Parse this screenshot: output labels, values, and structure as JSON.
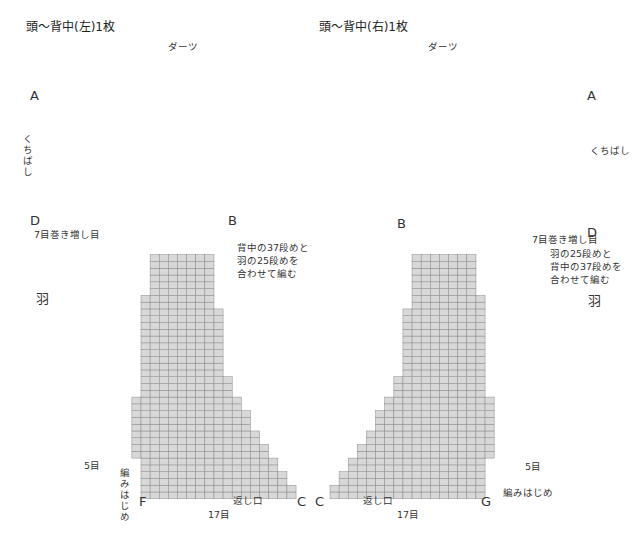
{
  "colors": {
    "dark": "#7d7d7d",
    "dark_dash": "#4a4a4a",
    "dart": "#5e5e5e",
    "light": "#d8d8d8",
    "white": "#ffffff",
    "grid": "#8a8a8a"
  },
  "grid": {
    "cw": 9.12,
    "rh": 6.78
  },
  "left_piece": {
    "title": "頭〜背中(左)1枚",
    "dart_label": "ダーツ",
    "beak_label": "くちばし",
    "increase_label": "7目巻き増し目",
    "join_note": [
      "背中の37段めと",
      "羽の25段めを",
      "合わせて編む"
    ],
    "wing_label": "羽",
    "wing_width": "5目",
    "start_label": "編みはじめ",
    "opening_label": "返し口",
    "width_label": "17目",
    "letters": {
      "A": "A",
      "B": "B",
      "C": "C",
      "D": "D",
      "F": "F"
    },
    "row_numbers_head": [
      "64",
      "60",
      "55",
      "50",
      "45",
      "40",
      "35"
    ],
    "row_numbers_body": [
      "30",
      "25",
      "20",
      "15",
      "10",
      "5",
      "1"
    ],
    "row_numbers_wing": [
      "24",
      "20",
      "15",
      "10",
      "5",
      "1"
    ]
  },
  "right_piece": {
    "title": "頭〜背中(右)1枚",
    "dart_label": "ダーツ",
    "beak_label": "くちばし",
    "increase_label": "7目巻き増し目",
    "join_note": [
      "羽の25段めと",
      "背中の37段めを",
      "合わせて編む"
    ],
    "wing_label": "羽",
    "wing_width": "5目",
    "start_label": "編みはじめ",
    "opening_label": "返し口",
    "width_label": "17目",
    "letters": {
      "A": "A",
      "B": "B",
      "C": "C",
      "D": "D",
      "G": "G"
    },
    "row_numbers_head": [
      "52",
      "50",
      "45",
      "40",
      "35",
      "30"
    ],
    "row_numbers_body": [
      "35",
      "30",
      "25",
      "20",
      "15",
      "10",
      "5",
      "1"
    ],
    "row_numbers_wing": [
      "24",
      "20",
      "15",
      "10",
      "5",
      "1"
    ]
  }
}
